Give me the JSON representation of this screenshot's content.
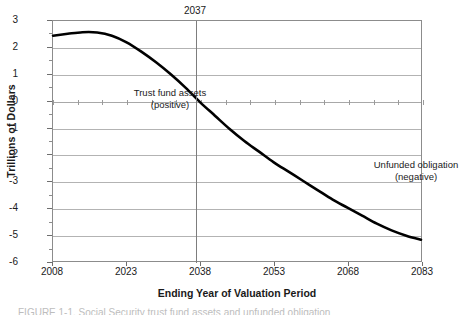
{
  "chart_data": {
    "type": "line",
    "title": "",
    "xlabel": "Ending Year of Valuation Period",
    "ylabel": "Trillions of Dollars",
    "xlim": [
      2008,
      2083
    ],
    "ylim": [
      -6,
      3
    ],
    "grid": true,
    "legend_position": "none",
    "x_ticks": [
      "2008",
      "2023",
      "2038",
      "2053",
      "2068",
      "2083"
    ],
    "x_tick_values": [
      2008,
      2023,
      2038,
      2053,
      2068,
      2083
    ],
    "y_ticks": [
      "3",
      "2",
      "1",
      "0",
      "-1",
      "-2",
      "-3",
      "-4",
      "-5",
      "-6"
    ],
    "y_tick_values": [
      3,
      2,
      1,
      0,
      -1,
      -2,
      -3,
      -4,
      -5,
      -6
    ],
    "x": [
      2008,
      2011,
      2014,
      2017,
      2020,
      2023,
      2026,
      2029,
      2032,
      2035,
      2038,
      2041,
      2044,
      2047,
      2050,
      2053,
      2056,
      2059,
      2062,
      2065,
      2068,
      2071,
      2074,
      2077,
      2080,
      2083
    ],
    "series": [
      {
        "name": "Trust fund assets / unfunded obligation",
        "color": "#000000",
        "values": [
          2.45,
          2.52,
          2.58,
          2.57,
          2.45,
          2.2,
          1.85,
          1.45,
          1.0,
          0.5,
          -0.05,
          -0.55,
          -1.05,
          -1.5,
          -1.9,
          -2.3,
          -2.65,
          -3.0,
          -3.35,
          -3.7,
          -4.0,
          -4.3,
          -4.6,
          -4.85,
          -5.05,
          -5.2
        ]
      }
    ],
    "reference_line": {
      "label": "2037",
      "x_value": 2037,
      "color": "#7d7d7d"
    },
    "annotations": [
      {
        "name": "trust-fund-assets",
        "line1": "Trust fund assets",
        "line2": "(positive)"
      },
      {
        "name": "unfunded-obligation",
        "line1": "Unfunded obligation",
        "line2": "(negative)"
      }
    ],
    "zero_line_tick_interval_years": 5
  },
  "caption": {
    "clipped_text": "FIGURE 1-1.  Social Security trust fund assets and unfunded obligation"
  }
}
